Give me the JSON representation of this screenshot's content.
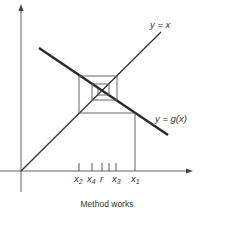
{
  "diagram": {
    "caption": "Method works",
    "labels": {
      "identity_line": "y = x",
      "g_curve": "y = g(x)"
    },
    "x_ticks": [
      {
        "name": "x2",
        "base": "x",
        "sub": "2"
      },
      {
        "name": "x4",
        "base": "x",
        "sub": "4"
      },
      {
        "name": "r",
        "base": "r",
        "sub": ""
      },
      {
        "name": "x3",
        "base": "x",
        "sub": "3"
      },
      {
        "name": "x1",
        "base": "x",
        "sub": "1"
      }
    ],
    "colors": {
      "axis": "#555555",
      "line": "#333333",
      "g_line": "#2a2a2a",
      "cobweb": "#555555",
      "text": "#333333"
    }
  }
}
